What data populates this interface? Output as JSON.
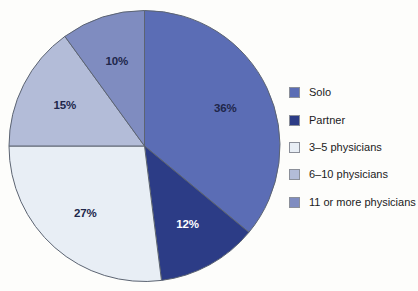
{
  "chart_data": {
    "type": "pie",
    "title": "",
    "subtitle": "",
    "xlabel": "",
    "ylabel": "",
    "legend_position": "right",
    "grid": false,
    "start_angle_deg": 0,
    "direction": "clockwise",
    "categories": [
      "Solo",
      "Partner",
      "3–5 physicians",
      "6–10 physicians",
      "11 or more physicians"
    ],
    "values": [
      36,
      12,
      27,
      15,
      10
    ],
    "value_labels": [
      "36%",
      "12%",
      "27%",
      "15%",
      "10%"
    ],
    "colors": [
      "#5b6db5",
      "#2c3c86",
      "#e8eef5",
      "#b3bcd8",
      "#7f8cc0"
    ],
    "label_text_colors": [
      "#20264a",
      "#ffffff",
      "#20264a",
      "#20264a",
      "#20264a"
    ],
    "slice_border_color": "#5c6472",
    "background_color": "#fdfdfb"
  },
  "legend": {
    "items": [
      {
        "label": "Solo",
        "color": "#5b6db5"
      },
      {
        "label": "Partner",
        "color": "#2c3c86"
      },
      {
        "label": "3–5 physicians",
        "color": "#e8eef5"
      },
      {
        "label": "6–10 physicians",
        "color": "#b3bcd8"
      },
      {
        "label": "11 or more physicians",
        "color": "#7f8cc0"
      }
    ]
  },
  "slices": [
    {
      "name": "solo",
      "label": "36%"
    },
    {
      "name": "partner",
      "label": "12%"
    },
    {
      "name": "three-to-five",
      "label": "27%"
    },
    {
      "name": "six-to-ten",
      "label": "15%"
    },
    {
      "name": "eleven-or-more",
      "label": "10%"
    }
  ]
}
